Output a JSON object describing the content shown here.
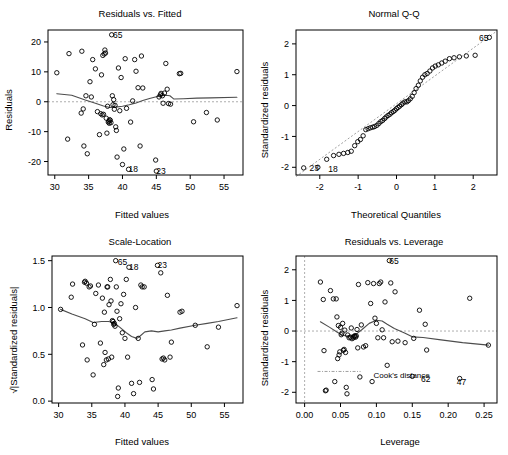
{
  "figure": {
    "kind": "r-regression-diagnostic-plots",
    "panel_count": 4,
    "background": "#ffffff",
    "point_color": "#000000",
    "smoother_color": "#4d4d4d",
    "reference_line_color": "#999999"
  },
  "chart_data": [
    {
      "type": "scatter",
      "panel": "top-left",
      "title": "Residuals vs. Fitted",
      "xlabel": "Fitted values",
      "ylabel": "Residuals",
      "xlim": [
        29.0,
        57.8
      ],
      "ylim": [
        -24.5,
        24.0
      ],
      "xticks": [
        30,
        35,
        40,
        45,
        50,
        55
      ],
      "yticks": [
        -20,
        -10,
        0,
        10,
        20
      ],
      "xticklabels": [
        "30",
        "35",
        "40",
        "45",
        "50",
        "55"
      ],
      "yticklabels": [
        "-20",
        "-10",
        "0",
        "10",
        "20"
      ],
      "grid": false,
      "legend": null,
      "reference_lines": [
        {
          "orientation": "horizontal",
          "value": 0,
          "style": "dashed"
        }
      ],
      "annotations": [
        {
          "text": "65",
          "x": 38.6,
          "y": 22.4
        },
        {
          "text": "18",
          "x": 40.9,
          "y": -22.6
        },
        {
          "text": "23",
          "x": 45.0,
          "y": -23.2
        }
      ],
      "x": [
        30.3,
        31.9,
        32.1,
        33.9,
        34.0,
        34.2,
        34.3,
        34.6,
        34.8,
        35.2,
        35.4,
        35.6,
        36.0,
        36.3,
        36.6,
        36.8,
        36.9,
        37.0,
        37.1,
        37.2,
        37.3,
        37.4,
        37.5,
        37.6,
        37.7,
        37.8,
        37.9,
        38.0,
        38.05,
        38.1,
        38.2,
        38.3,
        38.4,
        38.5,
        38.6,
        38.7,
        38.8,
        38.9,
        39.0,
        39.1,
        39.2,
        39.4,
        39.6,
        39.8,
        40.0,
        40.2,
        40.4,
        40.6,
        40.9,
        41.2,
        41.5,
        41.8,
        42.0,
        42.3,
        42.6,
        42.8,
        43.0,
        44.9,
        45.0,
        45.4,
        45.6,
        45.7,
        45.9,
        46.0,
        46.2,
        46.4,
        46.6,
        46.8,
        47.1,
        48.4,
        48.6,
        50.5,
        52.4,
        54.0,
        56.9
      ],
      "y": [
        9.7,
        -12.5,
        16.1,
        -3.8,
        16.9,
        -2.4,
        -14.8,
        2.0,
        -17.4,
        6.7,
        1.6,
        14.1,
        11.0,
        -3.3,
        -11.0,
        -4.0,
        9.0,
        -4.4,
        15.5,
        -4.2,
        16.0,
        17.3,
        16.3,
        -5.5,
        -10.5,
        -1.5,
        -6.8,
        -6.5,
        -7.2,
        -6.0,
        -6.2,
        -7.0,
        22.4,
        2.0,
        -1.0,
        0.7,
        -2.5,
        -1.2,
        -8.4,
        -9.6,
        -18.5,
        11.3,
        -3.0,
        8.1,
        -21.0,
        -15.8,
        14.4,
        -2.2,
        -22.6,
        -6.8,
        0.3,
        14.1,
        10.2,
        4.7,
        -14.8,
        15.3,
        4.6,
        -19.5,
        -23.2,
        1.6,
        2.3,
        2.8,
        2.0,
        -0.5,
        2.9,
        12.8,
        4.2,
        -0.6,
        -0.8,
        9.4,
        9.5,
        -6.7,
        -3.6,
        -6.1,
        10.1
      ],
      "smoother": {
        "type": "lowess",
        "x": [
          30.3,
          32.5,
          34.5,
          36.0,
          37.2,
          38.2,
          39.0,
          40.0,
          41.0,
          42.0,
          43.0,
          44.0,
          45.0,
          45.8,
          46.4,
          47.0,
          47.6,
          49.0,
          51.0,
          53.0,
          56.9
        ],
        "y": [
          2.7,
          2.2,
          0.6,
          -0.5,
          -1.4,
          -1.9,
          -1.8,
          -1.5,
          -1.0,
          -0.4,
          0.4,
          1.1,
          1.7,
          2.1,
          2.2,
          2.0,
          0.9,
          1.0,
          1.2,
          1.3,
          1.5
        ]
      }
    },
    {
      "type": "scatter",
      "panel": "top-right",
      "title": "Normal Q-Q",
      "xlabel": "Theoretical Quantiles",
      "ylabel": "Standardized residuals",
      "xlim": [
        -2.62,
        2.62
      ],
      "ylim": [
        -2.25,
        2.45
      ],
      "xticks": [
        -2,
        -1,
        0,
        1,
        2
      ],
      "yticks": [
        -2,
        -1,
        0,
        1,
        2
      ],
      "xticklabels": [
        "-2",
        "-1",
        "0",
        "1",
        "2"
      ],
      "yticklabels": [
        "-2",
        "-1",
        "0",
        "1",
        "2"
      ],
      "grid": false,
      "legend": null,
      "reference_lines": [
        {
          "orientation": "qq-line",
          "style": "dashed"
        }
      ],
      "annotations": [
        {
          "text": "65",
          "x": 2.15,
          "y": 2.2
        },
        {
          "text": "23",
          "x": -2.27,
          "y": -2.02
        },
        {
          "text": "18",
          "x": -1.78,
          "y": -2.05
        }
      ],
      "x": [
        -2.42,
        -2.05,
        -1.82,
        -1.64,
        -1.5,
        -1.38,
        -1.27,
        -1.18,
        -1.09,
        -1.01,
        -0.94,
        -0.87,
        -0.8,
        -0.74,
        -0.68,
        -0.62,
        -0.57,
        -0.51,
        -0.46,
        -0.41,
        -0.36,
        -0.31,
        -0.27,
        -0.22,
        -0.17,
        -0.13,
        -0.08,
        -0.04,
        0.0,
        0.04,
        0.08,
        0.13,
        0.17,
        0.22,
        0.27,
        0.31,
        0.36,
        0.41,
        0.46,
        0.51,
        0.57,
        0.62,
        0.68,
        0.74,
        0.8,
        0.87,
        0.94,
        1.01,
        1.09,
        1.18,
        1.27,
        1.38,
        1.5,
        1.64,
        1.82,
        2.05,
        2.42
      ],
      "y": [
        -2.02,
        -2.0,
        -1.74,
        -1.62,
        -1.58,
        -1.55,
        -1.52,
        -1.48,
        -1.3,
        -1.17,
        -1.1,
        -0.98,
        -0.78,
        -0.75,
        -0.72,
        -0.7,
        -0.68,
        -0.64,
        -0.58,
        -0.52,
        -0.48,
        -0.42,
        -0.37,
        -0.32,
        -0.28,
        -0.23,
        -0.19,
        -0.15,
        -0.1,
        -0.06,
        -0.02,
        0.03,
        0.08,
        0.12,
        0.12,
        0.16,
        0.22,
        0.3,
        0.42,
        0.55,
        0.66,
        0.8,
        0.92,
        1.0,
        1.04,
        1.12,
        1.22,
        1.28,
        1.32,
        1.38,
        1.44,
        1.52,
        1.55,
        1.58,
        1.61,
        1.63,
        2.21
      ],
      "qq_line": {
        "x": [
          -2.62,
          2.62
        ],
        "y": [
          -2.3,
          2.42
        ]
      }
    },
    {
      "type": "scatter",
      "panel": "bottom-left",
      "title": "Scale-Location",
      "xlabel": "Fitted values",
      "ylabel": "√|Standardized residuals|",
      "xlim": [
        29.0,
        57.8
      ],
      "ylim": [
        -0.02,
        1.55
      ],
      "xticks": [
        30,
        35,
        40,
        45,
        50,
        55
      ],
      "yticks": [
        0.0,
        0.5,
        1.0,
        1.5
      ],
      "xticklabels": [
        "30",
        "35",
        "40",
        "45",
        "50",
        "55"
      ],
      "yticklabels": [
        "0.0",
        "0.5",
        "1.0",
        "1.5"
      ],
      "grid": false,
      "legend": null,
      "reference_lines": [],
      "annotations": [
        {
          "text": "65",
          "x": 38.9,
          "y": 1.49
        },
        {
          "text": "18",
          "x": 40.6,
          "y": 1.43
        },
        {
          "text": "23",
          "x": 44.9,
          "y": 1.45
        }
      ],
      "x": [
        30.3,
        31.9,
        32.1,
        33.6,
        33.9,
        34.0,
        34.2,
        34.3,
        34.6,
        34.8,
        35.2,
        35.4,
        35.6,
        36.0,
        36.3,
        36.6,
        36.8,
        36.9,
        37.0,
        37.2,
        37.3,
        37.4,
        37.5,
        37.6,
        37.8,
        37.9,
        38.0,
        38.1,
        38.2,
        38.3,
        38.4,
        38.5,
        38.6,
        38.7,
        38.8,
        38.9,
        39.0,
        39.2,
        39.4,
        39.6,
        39.8,
        40.0,
        40.2,
        40.4,
        40.6,
        41.0,
        41.3,
        41.6,
        42.0,
        42.2,
        42.4,
        42.6,
        42.9,
        44.1,
        44.3,
        44.9,
        45.4,
        45.6,
        45.8,
        46.0,
        46.4,
        46.8,
        47.0,
        48.3,
        48.6,
        50.6,
        52.4,
        54.1,
        56.9
      ],
      "y": [
        0.98,
        1.11,
        1.25,
        0.6,
        1.27,
        1.28,
        1.26,
        0.44,
        1.22,
        1.23,
        0.28,
        0.82,
        1.15,
        1.24,
        0.62,
        1.1,
        0.39,
        0.95,
        0.52,
        0.44,
        1.22,
        1.22,
        0.45,
        1.03,
        1.3,
        1.07,
        0.47,
        0.86,
        0.85,
        0.82,
        0.83,
        0.8,
        1.5,
        1.22,
        0.96,
        0.05,
        0.14,
        0.88,
        1.04,
        0.73,
        1.14,
        0.67,
        1.3,
        0.47,
        1.43,
        0.19,
        0.08,
        1.0,
        0.67,
        0.2,
        1.24,
        1.22,
        1.22,
        0.23,
        0.13,
        1.45,
        1.37,
        0.45,
        0.46,
        0.44,
        1.13,
        0.47,
        0.63,
        0.95,
        0.96,
        0.81,
        0.58,
        0.79,
        1.02
      ],
      "smoother": {
        "type": "lowess",
        "x": [
          30.3,
          32.0,
          34.0,
          35.2,
          36.5,
          37.5,
          38.3,
          39.2,
          40.2,
          41.0,
          41.8,
          42.2,
          43.0,
          44.0,
          45.0,
          46.0,
          47.0,
          48.3,
          50.6,
          52.4,
          54.1,
          56.9
        ],
        "y": [
          0.98,
          0.93,
          0.88,
          0.84,
          0.85,
          0.85,
          0.84,
          0.79,
          0.73,
          0.69,
          0.67,
          0.69,
          0.74,
          0.75,
          0.74,
          0.75,
          0.76,
          0.78,
          0.81,
          0.83,
          0.85,
          0.89
        ]
      }
    },
    {
      "type": "scatter",
      "panel": "bottom-right",
      "title": "Residuals vs. Leverage",
      "xlabel": "Leverage",
      "ylabel": "Standardized residuals",
      "xlim": [
        -0.012,
        0.268
      ],
      "ylim": [
        -2.35,
        2.45
      ],
      "xticks": [
        0.0,
        0.05,
        0.1,
        0.15,
        0.2,
        0.25
      ],
      "yticks": [
        -2,
        -1,
        0,
        1,
        2
      ],
      "xticklabels": [
        "0.00",
        "0.05",
        "0.10",
        "0.15",
        "0.20",
        "0.25"
      ],
      "yticklabels": [
        "-2",
        "-1",
        "0",
        "1",
        "2"
      ],
      "grid": false,
      "legend": null,
      "reference_lines": [
        {
          "orientation": "horizontal",
          "value": 0,
          "style": "dashed"
        },
        {
          "orientation": "vertical",
          "value": 0,
          "style": "dashed"
        },
        {
          "orientation": "cooks-contour",
          "value": -1.32,
          "style": "dash-dot"
        }
      ],
      "annotations": [
        {
          "text": "65",
          "x": 0.118,
          "y": 2.3
        },
        {
          "text": "Cook's distance",
          "x": 0.096,
          "y": -1.44
        },
        {
          "text": "62",
          "x": 0.162,
          "y": -1.58
        },
        {
          "text": "47",
          "x": 0.212,
          "y": -1.68
        }
      ],
      "x": [
        0.022,
        0.026,
        0.027,
        0.029,
        0.03,
        0.036,
        0.04,
        0.042,
        0.044,
        0.045,
        0.046,
        0.047,
        0.048,
        0.049,
        0.05,
        0.051,
        0.052,
        0.053,
        0.054,
        0.055,
        0.056,
        0.057,
        0.058,
        0.059,
        0.06,
        0.062,
        0.064,
        0.065,
        0.066,
        0.068,
        0.069,
        0.07,
        0.071,
        0.072,
        0.073,
        0.074,
        0.075,
        0.077,
        0.079,
        0.082,
        0.085,
        0.088,
        0.092,
        0.094,
        0.096,
        0.098,
        0.1,
        0.102,
        0.104,
        0.106,
        0.108,
        0.11,
        0.112,
        0.115,
        0.118,
        0.12,
        0.122,
        0.126,
        0.13,
        0.14,
        0.15,
        0.152,
        0.16,
        0.168,
        0.17,
        0.216,
        0.23,
        0.256
      ],
      "y": [
        1.6,
        1.03,
        -0.64,
        -1.95,
        -1.93,
        1.32,
        1.05,
        -1.65,
        1.05,
        0.46,
        -0.9,
        0.18,
        -0.78,
        -0.68,
        0.12,
        -0.12,
        -0.07,
        0.25,
        -0.63,
        -0.6,
        0.03,
        -0.7,
        -1.84,
        -2.05,
        -0.13,
        -0.22,
        -0.2,
        0.1,
        -0.25,
        -0.22,
        -0.18,
        -0.15,
        -0.2,
        -0.16,
        0.05,
        -0.55,
        1.52,
        -1.5,
        0.2,
        -0.52,
        -0.48,
        1.58,
        0.9,
        -1.65,
        1.55,
        0.42,
        0.25,
        -0.22,
        1.55,
        1.6,
        0.04,
        -0.22,
        0.95,
        -1.12,
        2.3,
        1.57,
        -0.35,
        1.28,
        -0.33,
        -0.38,
        -1.48,
        -0.24,
        0.68,
        0.22,
        -0.62,
        -1.55,
        1.07,
        -0.46
      ],
      "smoother": {
        "type": "lowess",
        "x": [
          0.022,
          0.035,
          0.045,
          0.052,
          0.058,
          0.065,
          0.072,
          0.08,
          0.09,
          0.1,
          0.108,
          0.115,
          0.125,
          0.14,
          0.15,
          0.165,
          0.19,
          0.22,
          0.256
        ],
        "y": [
          0.3,
          0.12,
          -0.03,
          -0.13,
          -0.16,
          -0.15,
          -0.1,
          0.05,
          0.25,
          0.35,
          0.33,
          0.22,
          0.08,
          -0.07,
          -0.19,
          -0.21,
          -0.29,
          -0.38,
          -0.46
        ]
      },
      "cooks_contour": {
        "x_start": 0.018,
        "x_end": 0.078,
        "y": -1.32
      }
    }
  ]
}
